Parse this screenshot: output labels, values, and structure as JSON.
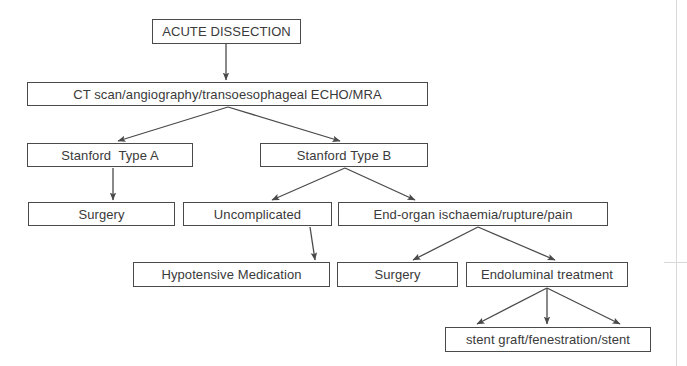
{
  "figure": {
    "kind": "clinical-management-flowchart",
    "title": "ACUTE DISSECTION",
    "width": 687,
    "height": 366,
    "background_color": "#ffffff",
    "line_color": "#4a4a4a",
    "text_color": "#3a3a3a"
  },
  "nodes": [
    {
      "id": "acute-dissection",
      "label": "ACUTE DISSECTION",
      "x": 152,
      "y": 19,
      "w": 149,
      "h": 25,
      "level": 0
    },
    {
      "id": "imaging",
      "label": "CT scan/angiography/transoesophageal ECHO/MRA",
      "x": 27,
      "y": 82,
      "w": 401,
      "h": 24,
      "level": 1
    },
    {
      "id": "stanford-type-a",
      "label": "Stanford  Type A",
      "x": 27,
      "y": 143,
      "w": 166,
      "h": 24,
      "level": 2
    },
    {
      "id": "stanford-type-b",
      "label": "Stanford Type B",
      "x": 260,
      "y": 143,
      "w": 168,
      "h": 24,
      "level": 2
    },
    {
      "id": "surgery-type-a",
      "label": "Surgery",
      "x": 28,
      "y": 202,
      "w": 147,
      "h": 24,
      "level": 3
    },
    {
      "id": "uncomplicated",
      "label": "Uncomplicated",
      "x": 183,
      "y": 202,
      "w": 149,
      "h": 24,
      "level": 3
    },
    {
      "id": "end-organ-ischaemia",
      "label": "End-organ ischaemia/rupture/pain",
      "x": 338,
      "y": 202,
      "w": 270,
      "h": 24,
      "level": 3
    },
    {
      "id": "hypotensive-medication",
      "label": "Hypotensive Medication",
      "x": 133,
      "y": 262,
      "w": 197,
      "h": 25,
      "level": 4
    },
    {
      "id": "surgery-end-organ",
      "label": "Surgery",
      "x": 337,
      "y": 262,
      "w": 121,
      "h": 25,
      "level": 4
    },
    {
      "id": "endoluminal-treatment",
      "label": "Endoluminal treatment",
      "x": 466,
      "y": 262,
      "w": 162,
      "h": 25,
      "level": 4
    },
    {
      "id": "stent-graft",
      "label": "stent graft/fenestration/stent",
      "x": 445,
      "y": 327,
      "w": 206,
      "h": 25,
      "level": 5
    }
  ],
  "edges": [
    {
      "id": "e1",
      "from": "acute-dissection",
      "to": "imaging",
      "x1": 226,
      "y1": 44,
      "x2": 226,
      "y2": 80,
      "arrow": true
    },
    {
      "id": "e2",
      "from": "imaging",
      "to": "stanford-type-a",
      "x1": 228,
      "y1": 107,
      "x2": 118,
      "y2": 141,
      "arrow": true
    },
    {
      "id": "e3",
      "from": "imaging",
      "to": "stanford-type-b",
      "x1": 228,
      "y1": 107,
      "x2": 340,
      "y2": 141,
      "arrow": true
    },
    {
      "id": "e4",
      "from": "stanford-type-a",
      "to": "surgery-type-a",
      "x1": 113,
      "y1": 168,
      "x2": 113,
      "y2": 200,
      "arrow": true
    },
    {
      "id": "e5",
      "from": "stanford-type-b",
      "to": "uncomplicated",
      "x1": 345,
      "y1": 168,
      "x2": 272,
      "y2": 200,
      "arrow": true
    },
    {
      "id": "e6",
      "from": "stanford-type-b",
      "to": "end-organ-ischaemia",
      "x1": 345,
      "y1": 168,
      "x2": 415,
      "y2": 200,
      "arrow": true
    },
    {
      "id": "e7",
      "from": "uncomplicated",
      "to": "hypotensive-medication",
      "x1": 310,
      "y1": 227,
      "x2": 315,
      "y2": 260,
      "arrow": true
    },
    {
      "id": "e8",
      "from": "end-organ-ischaemia",
      "to": "surgery-end-organ",
      "x1": 478,
      "y1": 227,
      "x2": 413,
      "y2": 260,
      "arrow": true
    },
    {
      "id": "e9",
      "from": "end-organ-ischaemia",
      "to": "endoluminal-treatment",
      "x1": 478,
      "y1": 227,
      "x2": 555,
      "y2": 260,
      "arrow": true
    },
    {
      "id": "e10",
      "from": "endoluminal-treatment",
      "to": "stent-graft",
      "x1": 547,
      "y1": 288,
      "x2": 477,
      "y2": 324,
      "arrow": true
    },
    {
      "id": "e11",
      "from": "endoluminal-treatment",
      "to": "stent-graft",
      "x1": 547,
      "y1": 288,
      "x2": 547,
      "y2": 324,
      "arrow": true
    },
    {
      "id": "e12",
      "from": "endoluminal-treatment",
      "to": "stent-graft",
      "x1": 547,
      "y1": 288,
      "x2": 620,
      "y2": 324,
      "arrow": true
    }
  ],
  "scan_artifacts": [
    {
      "id": "right-margin-rule",
      "orientation": "vert",
      "x": 676,
      "y": 0,
      "length": 366
    },
    {
      "id": "lower-right-rule",
      "orientation": "horiz",
      "x": 664,
      "y": 262,
      "length": 23
    }
  ]
}
